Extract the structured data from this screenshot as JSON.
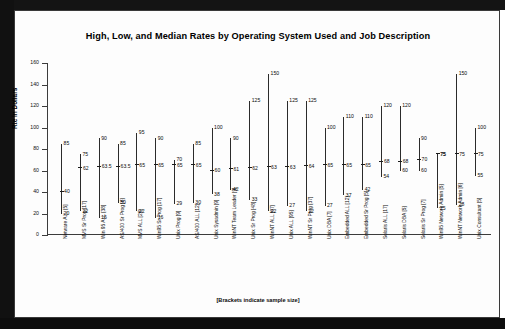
{
  "chart_data": {
    "type": "range",
    "title": "High, Low, and Median Rates by Operating System Used and Job Description",
    "xlabel": "",
    "ylabel": "Rte in Dollars",
    "ylim": [
      0,
      160
    ],
    "yticks": [
      0,
      20,
      40,
      60,
      80,
      100,
      120,
      140,
      160
    ],
    "grid": false,
    "legend": null,
    "footnote": "[Brackets indicate sample size]",
    "series_labels": [
      "High",
      "Median",
      "Low"
    ],
    "categories": [
      "Netware ALL [5]",
      "MVS Sr Prog [17]",
      "Win 95 ALL [38]",
      "AS/400 Sr Prog [6]",
      "MVS ALL [26]",
      "Win95 Sr Prog [17]",
      "Unix Prog [9]",
      "AS/400 ALL [12]",
      "Unix Sysadmin [9]",
      "WinNT Team Leader [9]",
      "Unix Sr Prog [48]",
      "WinNT ALL [67]",
      "Unix ALL [95]",
      "WinNT Sr Prog [37]",
      "Unix DBA [7]",
      "Embedded ALL [12]",
      "Embedded Sr Prog [5]",
      "Solaris ALL [17]",
      "Solaris DBA [5]",
      "Solaris Sr Prog [7]",
      "Win95 Network Admin [5]",
      "WinNT Network Admin [6]",
      "Unix Consultant [5]"
    ],
    "high": [
      85,
      75,
      90,
      63.5,
      95,
      90,
      90,
      70,
      85,
      100,
      90,
      125,
      150,
      125,
      125,
      100,
      110,
      110,
      120,
      120,
      90,
      75,
      150,
      100
    ],
    "median": [
      40,
      62,
      63.5,
      63.5,
      65,
      65,
      65,
      65,
      65,
      60,
      61,
      62,
      63,
      63,
      64,
      65,
      65,
      65,
      68,
      68,
      70,
      75,
      75,
      75
    ],
    "low": [
      20,
      22,
      16,
      30,
      22,
      16,
      16,
      29,
      30,
      38,
      42,
      33,
      22,
      27,
      22,
      27,
      37,
      42,
      54,
      60,
      60,
      25,
      28,
      55
    ],
    "points": [
      {
        "label": "Netware ALL [5]",
        "high": 85,
        "median": 40,
        "low": 20
      },
      {
        "label": "MVS Sr Prog [17]",
        "high": 75,
        "median": 62,
        "low": 22
      },
      {
        "label": "Win 95 ALL [38]",
        "high": 90,
        "median": 63.5,
        "low": 16
      },
      {
        "label": "AS/400 Sr Prog [6]",
        "high": 85,
        "median": 63.5,
        "low": 30
      },
      {
        "label": "MVS ALL [26]",
        "high": 95,
        "median": 65,
        "low": 22
      },
      {
        "label": "Win95 Sr Prog [17]",
        "high": 90,
        "median": 65,
        "low": 16
      },
      {
        "label": "Unix Prog [9]",
        "high": 70,
        "median": 65,
        "low": 29
      },
      {
        "label": "AS/400 ALL [12]",
        "high": 85,
        "median": 65,
        "low": 30
      },
      {
        "label": "Unix Sysadmin [9]",
        "high": 100,
        "median": 60,
        "low": 38
      },
      {
        "label": "WinNT Team Leader [9]",
        "high": 90,
        "median": 61,
        "low": 42
      },
      {
        "label": "Unix Sr Prog [48]",
        "high": 125,
        "median": 62,
        "low": 33
      },
      {
        "label": "WinNT ALL [67]",
        "high": 150,
        "median": 63,
        "low": 22
      },
      {
        "label": "Unix ALL [95]",
        "high": 125,
        "median": 63,
        "low": 27
      },
      {
        "label": "WinNT Sr Prog [37]",
        "high": 125,
        "median": 64,
        "low": 22
      },
      {
        "label": "Unix DBA [7]",
        "high": 100,
        "median": 65,
        "low": 27
      },
      {
        "label": "Embedded ALL [12]",
        "high": 110,
        "median": 65,
        "low": 37
      },
      {
        "label": "Embedded Sr Prog [5]",
        "high": 110,
        "median": 65,
        "low": 42
      },
      {
        "label": "Solaris ALL [17]",
        "high": 120,
        "median": 68,
        "low": 54
      },
      {
        "label": "Solaris DBA [5]",
        "high": 120,
        "median": 68,
        "low": 60
      },
      {
        "label": "Solaris Sr Prog [7]",
        "high": 90,
        "median": 70,
        "low": 60
      },
      {
        "label": "Win95 Network Admin [5]",
        "high": 75,
        "median": 75,
        "low": 25
      },
      {
        "label": "WinNT Network Admin [6]",
        "high": 150,
        "median": 75,
        "low": 28
      },
      {
        "label": "Unix Consultant [5]",
        "high": 100,
        "median": 75,
        "low": 55
      }
    ]
  },
  "colors": {
    "line": "#2b2b2b",
    "axis": "#3c3c3c",
    "text": "#0a0a0a",
    "page": "#fdfdfd",
    "frame": "#3a3a3a"
  }
}
